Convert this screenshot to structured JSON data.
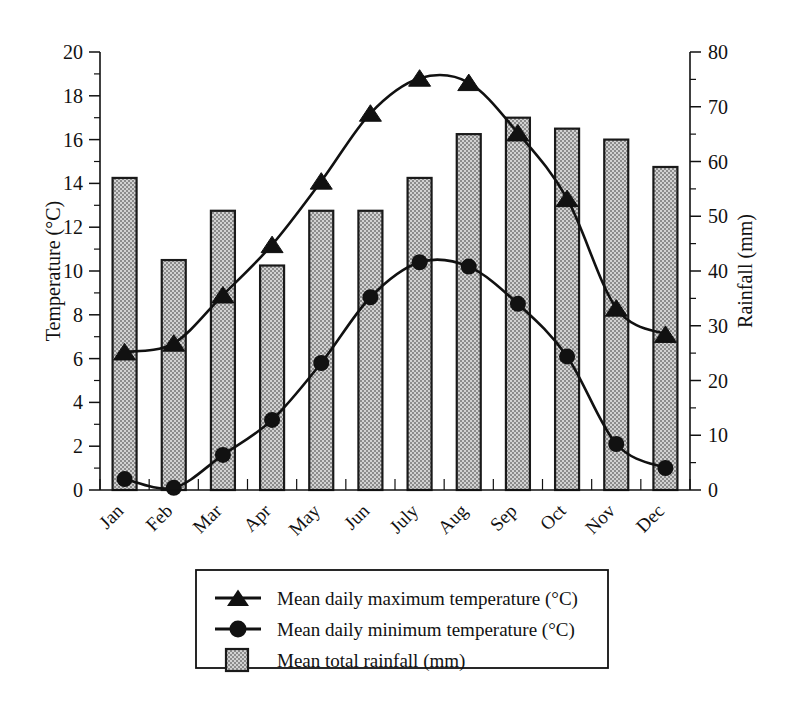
{
  "chart_data": {
    "type": "bar",
    "title": "",
    "subtitle": "",
    "categories": [
      "Jan",
      "Feb",
      "Mar",
      "Apr",
      "May",
      "Jun",
      "July",
      "Aug",
      "Sep",
      "Oct",
      "Nov",
      "Dec"
    ],
    "xlabel": "",
    "grid": false,
    "legend_position": "bottom",
    "axes": {
      "left": {
        "label": "Temperature (°C)",
        "ylim": [
          0,
          20
        ],
        "ticks": [
          0,
          2,
          4,
          6,
          8,
          10,
          12,
          14,
          16,
          18,
          20
        ],
        "tick_labels": [
          "0",
          "2",
          "4",
          "6",
          "8",
          "10",
          "12",
          "14",
          "16",
          "18",
          "20"
        ],
        "minor_tick_step": 1
      },
      "right": {
        "label": "Rainfall (mm)",
        "ylim": [
          0,
          80
        ],
        "ticks": [
          0,
          10,
          20,
          30,
          40,
          50,
          60,
          70,
          80
        ],
        "tick_labels": [
          "0",
          "10",
          "20",
          "30",
          "40",
          "50",
          "60",
          "70",
          "80"
        ],
        "minor_tick_step": 5
      }
    },
    "series": [
      {
        "name": "Mean daily maximum temperature (°C)",
        "type": "line",
        "marker": "triangle",
        "axis": "left",
        "unit": "°C",
        "values": [
          6.3,
          6.7,
          8.9,
          11.2,
          14.1,
          17.2,
          18.8,
          18.6,
          16.3,
          13.3,
          8.3,
          7.1
        ]
      },
      {
        "name": "Mean daily minimum temperature (°C)",
        "type": "line",
        "marker": "circle",
        "axis": "left",
        "unit": "°C",
        "values": [
          0.5,
          0.1,
          1.6,
          3.2,
          5.8,
          8.8,
          10.4,
          10.2,
          8.5,
          6.1,
          2.1,
          1.0
        ]
      },
      {
        "name": "Mean total rainfall (mm)",
        "type": "bar",
        "marker": "square-stippled",
        "axis": "right",
        "unit": "mm",
        "values": [
          57,
          42,
          51,
          41,
          51,
          51,
          57,
          65,
          68,
          66,
          64,
          59
        ]
      }
    ]
  },
  "legend": {
    "entries": [
      {
        "label": "Mean daily maximum temperature (°C)",
        "marker": "triangle-line"
      },
      {
        "label": "Mean daily minimum temperature (°C)",
        "marker": "circle-line"
      },
      {
        "label": "Mean total rainfall (mm)",
        "marker": "stippled-square"
      }
    ]
  },
  "colors": {
    "ink": "#111111",
    "bar_fill": "#c9c9c9",
    "bar_stroke": "#1a1a1a",
    "background": "#ffffff"
  }
}
